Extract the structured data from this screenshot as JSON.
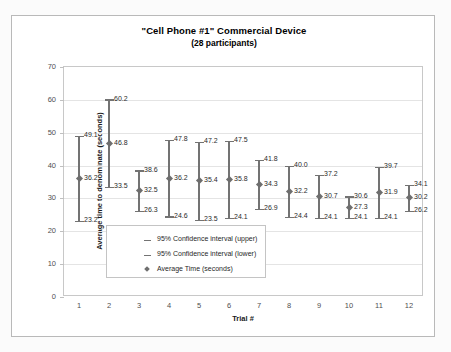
{
  "chart_data": {
    "type": "scatter",
    "title": "\"Cell Phone #1\" Commercial Device",
    "subtitle": "(28 participants)",
    "xlabel": "Trial #",
    "ylabel": "Average time to denominate (seconds)",
    "ylim": [
      0,
      70
    ],
    "ytick_labels": [
      "0",
      "10",
      "20",
      "30",
      "40",
      "50",
      "60",
      "70"
    ],
    "yticks": [
      0,
      10,
      20,
      30,
      40,
      50,
      60,
      70
    ],
    "grid": true,
    "legend_position": "inside-bottom-left",
    "categories": [
      "1",
      "2",
      "3",
      "4",
      "5",
      "6",
      "7",
      "8",
      "9",
      "10",
      "11",
      "12"
    ],
    "series": [
      {
        "name": "95% Confidence interval (upper)",
        "values": [
          49.1,
          60.2,
          38.6,
          47.8,
          47.2,
          47.5,
          41.8,
          40.0,
          37.2,
          30.6,
          39.7,
          34.1
        ]
      },
      {
        "name": "Average Time (seconds)",
        "values": [
          36.2,
          46.8,
          32.5,
          36.2,
          35.4,
          35.8,
          34.3,
          32.2,
          30.7,
          27.3,
          31.9,
          30.2
        ]
      },
      {
        "name": "95% Confidence interval (lower)",
        "values": [
          23.2,
          33.5,
          26.3,
          24.6,
          23.5,
          24.1,
          26.9,
          24.4,
          24.1,
          24.1,
          24.1,
          26.2
        ]
      }
    ],
    "point_labels": {
      "upper": [
        "49.1",
        "60.2",
        "38.6",
        "47.8",
        "47.2",
        "47.5",
        "41.8",
        "40.0",
        "37.2",
        "30.6",
        "39.7",
        "34.1"
      ],
      "mean": [
        "36.2",
        "46.8",
        "32.5",
        "36.2",
        "35.4",
        "35.8",
        "34.3",
        "32.2",
        "30.7",
        "27.3",
        "31.9",
        "30.2"
      ],
      "lower": [
        "23.2",
        "33.5",
        "26.3",
        "24.6",
        "23.5",
        "24.1",
        "26.9",
        "24.4",
        "24.1",
        "24.1",
        "24.1",
        "26.2"
      ]
    },
    "colors": {
      "marker": "#6e6e6e",
      "errorbar": "#737373",
      "gridline": "#e4e4e4",
      "plot_border": "#c8c8c8",
      "text": "#1f1f1f"
    }
  },
  "legend": {
    "items": [
      {
        "symbol": "dash",
        "label": "95% Confidence interval (upper)"
      },
      {
        "symbol": "dash",
        "label": "95% Confidence interval (lower)"
      },
      {
        "symbol": "diamond",
        "label": "Average Time (seconds)"
      }
    ]
  }
}
